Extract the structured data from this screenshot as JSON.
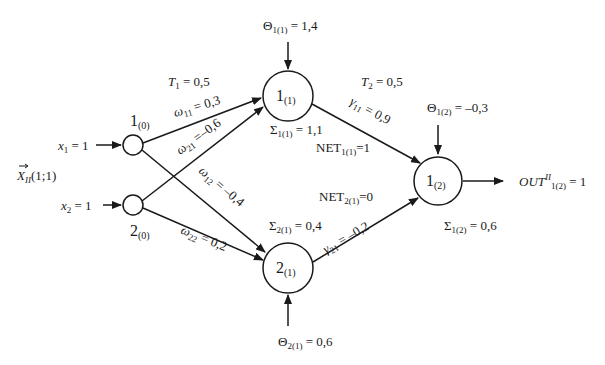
{
  "input": {
    "vector_label": "X",
    "vector_sub": "II",
    "vector_args": "(1;1)",
    "x1": {
      "var": "x",
      "sub": "1",
      "eq": " = 1"
    },
    "x2": {
      "var": "x",
      "sub": "2",
      "eq": " = 1"
    }
  },
  "nodes": {
    "in1": {
      "main": "1",
      "sub": "(0)"
    },
    "in2": {
      "main": "2",
      "sub": "(0)"
    },
    "h1": {
      "main": "1",
      "sub": "(1)"
    },
    "h2": {
      "main": "2",
      "sub": "(1)"
    },
    "out": {
      "main": "1",
      "sub": "(2)"
    }
  },
  "thresholds": {
    "T1": {
      "var": "T",
      "sub": "1",
      "eq": " = 0,5"
    },
    "T2": {
      "var": "T",
      "sub": "2",
      "eq": " = 0,5"
    }
  },
  "weights": {
    "w11": {
      "var": "ω",
      "sub": "11",
      "eq": " = 0,3"
    },
    "w21": {
      "var": "ω",
      "sub": "21",
      "eq": " =–0,6"
    },
    "w12": {
      "var": "ω",
      "sub": "12",
      "eq": " = –0,4"
    },
    "w22": {
      "var": "ω",
      "sub": "22",
      "eq": " = 0,2"
    },
    "g11": {
      "var": "γ",
      "sub": "11",
      "eq": " = 0,9"
    },
    "g21": {
      "var": "γ",
      "sub": "21",
      "eq": " = –0,2"
    }
  },
  "biases": {
    "theta_h1": {
      "var": "Θ",
      "sub": "1(1)",
      "eq": " = 1,4"
    },
    "theta_h2": {
      "var": "Θ",
      "sub": "2(1)",
      "eq": " = 0,6"
    },
    "theta_out": {
      "var": "Θ",
      "sub": "1(2)",
      "eq": " = –0,3"
    }
  },
  "sums": {
    "s_h1": {
      "var": "Σ",
      "sub": "1(1)",
      "eq": " = 1,1"
    },
    "s_h2": {
      "var": "Σ",
      "sub": "2(1)",
      "eq": " = 0,4"
    },
    "s_out": {
      "var": "Σ",
      "sub": "1(2)",
      "eq": " = 0,6"
    }
  },
  "net": {
    "net_h1": {
      "var": "NET",
      "sub": "1(1)",
      "eq": "=1"
    },
    "net_h2": {
      "var": "NET",
      "sub": "2(1)",
      "eq": "=0"
    }
  },
  "output": {
    "var": "OUT",
    "sup": "II",
    "sub": "1(2)",
    "eq": " = 1"
  }
}
